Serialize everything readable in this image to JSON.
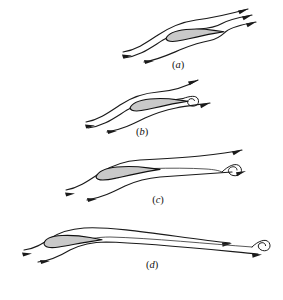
{
  "figure": {
    "background_color": "#ffffff",
    "line_color": "#1a1a1a",
    "airfoil_fill_color": "#c9c9c9",
    "airfoil_stroke_color": "#111111",
    "width": 283,
    "height": 300
  },
  "panels": [
    {
      "id": "panel-a",
      "label_open": "(",
      "label_letter": "a",
      "label_close": ")",
      "label": "(a)",
      "label_x": 178,
      "label_y": 68,
      "description": "Airfoil at angle of attack with smooth streamlines joining at the trailing edge; no vortex shed yet",
      "vortex_present": false,
      "streamline_count": 3,
      "arrowhead_count": 5
    },
    {
      "id": "panel-b",
      "label_open": "(",
      "label_letter": "b",
      "label_close": ")",
      "label": "(b)",
      "label_x": 142,
      "label_y": 135,
      "description": "Starting vortex forming immediately behind the trailing edge of the airfoil",
      "vortex_present": true,
      "vortex_position": "at trailing edge",
      "streamline_count": 3,
      "arrowhead_count": 4
    },
    {
      "id": "panel-c",
      "label_open": "(",
      "label_letter": "c",
      "label_close": ")",
      "label": "(c)",
      "label_x": 158,
      "label_y": 203,
      "description": "Starting vortex shed and convecting downstream away from the airfoil",
      "vortex_present": true,
      "vortex_position": "downstream, mid-field",
      "streamline_count": 3,
      "arrowhead_count": 4
    },
    {
      "id": "panel-d",
      "label_open": "(",
      "label_letter": "d",
      "label_close": ")",
      "label": "(d)",
      "label_x": 152,
      "label_y": 268,
      "description": "Starting vortex carried far downstream; steady circulatory flow established about the airfoil",
      "vortex_present": true,
      "vortex_position": "far downstream",
      "streamline_count": 3,
      "arrowhead_count": 4
    }
  ],
  "elements": {
    "airfoil_name": "airfoil-body",
    "streamline_name": "streamline",
    "vortex_name": "starting-vortex",
    "arrowhead_name": "flow-direction-arrowhead"
  }
}
